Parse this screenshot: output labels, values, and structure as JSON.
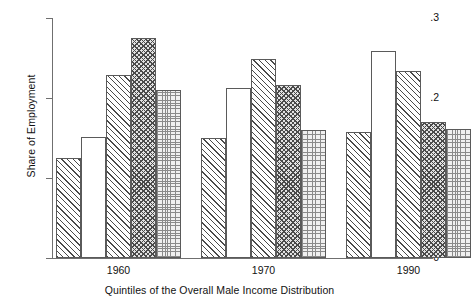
{
  "chart_data": {
    "type": "bar",
    "title": "",
    "subtitle": "",
    "xlabel": "Quintiles of the Overall Male Income Distribution",
    "ylabel": "Share of Employment",
    "ylim": [
      0,
      0.3
    ],
    "ytick_labels": [
      "0",
      ".1",
      ".2",
      ".3"
    ],
    "ytick_values": [
      0,
      0.1,
      0.2,
      0.3
    ],
    "grid": false,
    "legend": "none",
    "categories": [
      "1960",
      "1970",
      "1990"
    ],
    "group_label_positions": [
      "1960",
      "1970",
      "1990"
    ],
    "series": [
      {
        "name": "Quintile 1",
        "pattern": "diagonal-hatch",
        "values": [
          0.125,
          0.15,
          0.158
        ]
      },
      {
        "name": "Quintile 2",
        "pattern": "blank-white",
        "values": [
          0.151,
          0.212,
          0.259
        ]
      },
      {
        "name": "Quintile 3",
        "pattern": "diagonal-hatch",
        "values": [
          0.229,
          0.249,
          0.234
        ]
      },
      {
        "name": "Quintile 4",
        "pattern": "checkerboard",
        "values": [
          0.275,
          0.216,
          0.17
        ]
      },
      {
        "name": "Quintile 5",
        "pattern": "fine-dots",
        "values": [
          0.21,
          0.16,
          0.161
        ]
      }
    ],
    "bars": [
      {
        "group": "1960",
        "quintile": 1,
        "value": 0.125,
        "pattern": "diagonal-hatch"
      },
      {
        "group": "1960",
        "quintile": 2,
        "value": 0.151,
        "pattern": "blank-white"
      },
      {
        "group": "1960",
        "quintile": 3,
        "value": 0.229,
        "pattern": "diagonal-hatch"
      },
      {
        "group": "1960",
        "quintile": 4,
        "value": 0.275,
        "pattern": "checkerboard"
      },
      {
        "group": "1960",
        "quintile": 5,
        "value": 0.21,
        "pattern": "fine-dots"
      },
      {
        "group": "1970",
        "quintile": 1,
        "value": 0.15,
        "pattern": "diagonal-hatch"
      },
      {
        "group": "1970",
        "quintile": 2,
        "value": 0.212,
        "pattern": "blank-white"
      },
      {
        "group": "1970",
        "quintile": 3,
        "value": 0.249,
        "pattern": "diagonal-hatch"
      },
      {
        "group": "1970",
        "quintile": 4,
        "value": 0.216,
        "pattern": "checkerboard"
      },
      {
        "group": "1970",
        "quintile": 5,
        "value": 0.16,
        "pattern": "fine-dots"
      },
      {
        "group": "1990",
        "quintile": 1,
        "value": 0.158,
        "pattern": "diagonal-hatch"
      },
      {
        "group": "1990",
        "quintile": 2,
        "value": 0.259,
        "pattern": "blank-white"
      },
      {
        "group": "1990",
        "quintile": 3,
        "value": 0.234,
        "pattern": "diagonal-hatch"
      },
      {
        "group": "1990",
        "quintile": 4,
        "value": 0.17,
        "pattern": "checkerboard"
      },
      {
        "group": "1990",
        "quintile": 5,
        "value": 0.161,
        "pattern": "fine-dots"
      }
    ],
    "colors": {
      "axis": "#6f6f6f",
      "bar_outline": "#5a5a5a",
      "pattern_ink": "#4a4a4a",
      "background": "#ffffff",
      "text": "#111111"
    }
  },
  "axis": {
    "y_labels": [
      "0",
      ".1",
      ".2",
      ".3"
    ],
    "y_title": "Share of Employment",
    "x_title": "Quintiles of the Overall Male Income Distribution",
    "x_labels": [
      "1960",
      "1970",
      "1990"
    ]
  }
}
